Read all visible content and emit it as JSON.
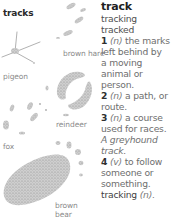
{
  "panel": {
    "title": "tracks",
    "labels": {
      "brown_hare": "brown hare",
      "pigeon": "pigeon",
      "reindeer": "reindeer",
      "fox": "fox",
      "brown_bear_1": "brown",
      "brown_bear_2": "bear"
    }
  },
  "entry": {
    "headword": "track",
    "forms": [
      "tracking",
      "tracked"
    ],
    "senses": [
      {
        "num": "1",
        "pos": "(n)",
        "lines": [
          "the marks",
          "left behind by",
          "a moving",
          "animal or",
          "person."
        ]
      },
      {
        "num": "2",
        "pos": "(n)",
        "lines": [
          "a path, or",
          "route."
        ]
      },
      {
        "num": "3",
        "pos": "(n)",
        "lines": [
          "a course",
          "used for races."
        ],
        "example": [
          "A greyhound",
          "track."
        ]
      },
      {
        "num": "4",
        "pos": "(v)",
        "lines": [
          "to follow",
          "someone or",
          "something."
        ]
      }
    ],
    "derivative": {
      "word": "tracking",
      "pos": "(n)."
    }
  },
  "colors": {
    "print_fill": "#c4c4c4",
    "print_edge": "#9a9a9a",
    "label": "#8a8a8a",
    "headword": "#1f1f1f"
  }
}
